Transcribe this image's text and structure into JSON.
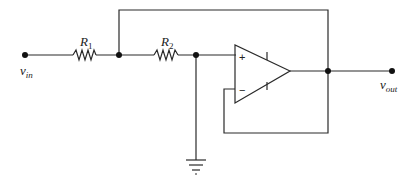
{
  "diagram": {
    "type": "op-amp circuit",
    "labels": {
      "vin": {
        "main": "v",
        "sub": "in"
      },
      "vout": {
        "main": "v",
        "sub": "out"
      },
      "r1": {
        "main": "R",
        "sub": "1"
      },
      "r2": {
        "main": "R",
        "sub": "2"
      }
    },
    "opamp": {
      "plus": "+",
      "minus": "−"
    },
    "components": [
      "input terminal v_in",
      "resistor R1",
      "resistor R2",
      "op-amp",
      "ground",
      "output terminal v_out",
      "feedback wire"
    ]
  }
}
